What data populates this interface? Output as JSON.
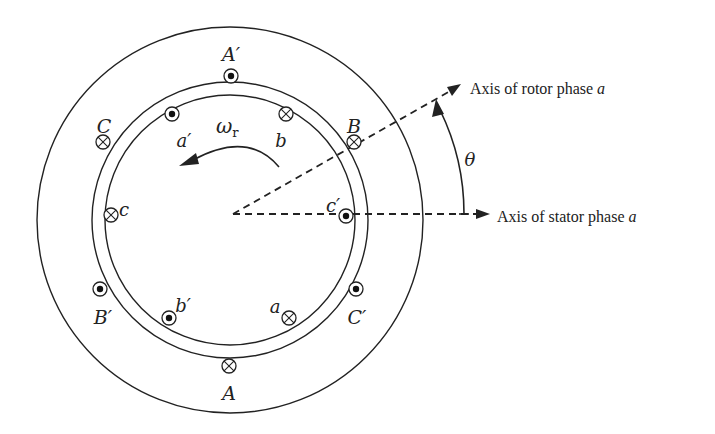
{
  "figure": {
    "center": [
      230,
      220
    ],
    "rings": [
      {
        "name": "stator-outer",
        "r": 193
      },
      {
        "name": "stator-inner",
        "r": 138
      },
      {
        "name": "rotor-surface",
        "r": 125
      }
    ],
    "stator_conductors": [
      {
        "id": "A-prime",
        "label": "A′",
        "type": "dot",
        "x": 231,
        "y": 76,
        "lx": 231,
        "ly": 55
      },
      {
        "id": "C",
        "label": "C",
        "type": "cross",
        "x": 103,
        "y": 142,
        "lx": 104,
        "ly": 127
      },
      {
        "id": "B",
        "label": "B",
        "type": "cross",
        "x": 354,
        "y": 142,
        "lx": 354,
        "ly": 127
      },
      {
        "id": "B-prime",
        "label": "B′",
        "type": "dot",
        "x": 100,
        "y": 289,
        "lx": 103,
        "ly": 318
      },
      {
        "id": "C-prime",
        "label": "C′",
        "type": "dot",
        "x": 356,
        "y": 289,
        "lx": 357,
        "ly": 318
      },
      {
        "id": "A",
        "label": "A",
        "type": "cross",
        "x": 229,
        "y": 366,
        "lx": 229,
        "ly": 394
      }
    ],
    "rotor_conductors": [
      {
        "id": "a-prime",
        "label": "a′",
        "type": "dot",
        "x": 172,
        "y": 114,
        "lx": 184,
        "ly": 141
      },
      {
        "id": "b",
        "label": "b",
        "type": "cross",
        "x": 286,
        "y": 114,
        "lx": 281,
        "ly": 141
      },
      {
        "id": "c",
        "label": "c",
        "type": "cross",
        "x": 111,
        "y": 215,
        "lx": 124,
        "ly": 210
      },
      {
        "id": "c-prime",
        "label": "c′",
        "type": "dot",
        "x": 346,
        "y": 216,
        "lx": 333,
        "ly": 206
      },
      {
        "id": "b-prime",
        "label": "b′",
        "type": "dot",
        "x": 169,
        "y": 318,
        "lx": 183,
        "ly": 306
      },
      {
        "id": "a",
        "label": "a",
        "type": "cross",
        "x": 289,
        "y": 318,
        "lx": 275,
        "ly": 307
      }
    ],
    "rotor_speed": {
      "symbol": "ω",
      "subscript": "r",
      "lx": 226,
      "ly": 133
    },
    "theta": {
      "symbol": "θ",
      "lx": 470,
      "ly": 166
    },
    "stator_axis": {
      "label_prefix": "Axis of stator phase ",
      "label_var": "a",
      "tx": 497,
      "ty": 222
    },
    "rotor_axis": {
      "label_prefix": "Axis of rotor phase ",
      "label_var": "a",
      "tx": 470,
      "ty": 94
    }
  }
}
